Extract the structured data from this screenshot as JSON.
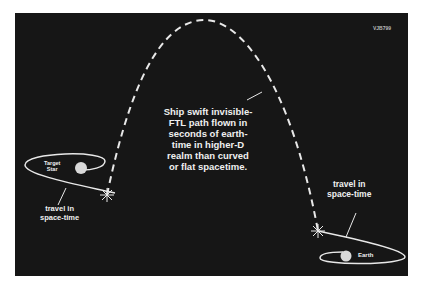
{
  "diagram": {
    "code": "VJB799",
    "main_caption": [
      "Ship swift invisible-",
      "FTL path flown in",
      "seconds   of earth-",
      "time in higher-D",
      "realm than curved",
      "or flat spacetime."
    ],
    "target_star": [
      "Target",
      "Star"
    ],
    "left_travel": [
      "travel in",
      "space-time"
    ],
    "right_travel": [
      "travel in",
      "space-time"
    ],
    "earth": "Earth",
    "colors": {
      "background": "#161616",
      "lines": "#e8e8e8",
      "text": "#f0f0f0",
      "planet": "#d9d9d9"
    }
  }
}
